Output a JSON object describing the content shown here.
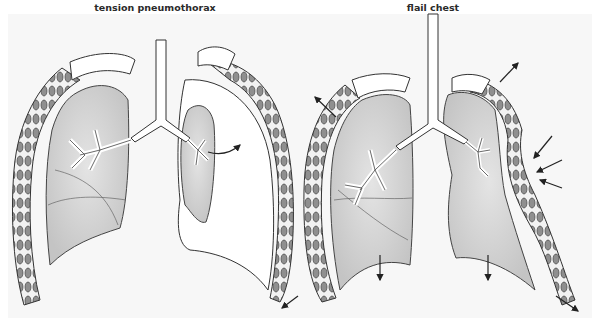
{
  "figure": {
    "panels": [
      {
        "id": "tension-pneumothorax",
        "title": "tension pneumothorax",
        "description": "Left lung normal; right lung collapsed with air filling pleural space; arrow indicates air entering pleural space; chest wall expanded outward",
        "arrows": [
          "air-leak-arrow",
          "chest-expansion-arrow-lower-right"
        ]
      },
      {
        "id": "flail-chest",
        "title": "flail chest",
        "description": "Both lungs shown; flail segment on right side moves inward (paradoxical motion) while rest of chest expands; diaphragm moves down",
        "arrows": [
          "expansion-arrow-upper-left",
          "expansion-arrow-upper-right",
          "paradoxical-inward-arrow-1",
          "paradoxical-inward-arrow-2",
          "paradoxical-inward-arrow-3",
          "diaphragm-down-arrow-left",
          "diaphragm-down-arrow-right",
          "expansion-arrow-lower-right"
        ]
      }
    ],
    "colors": {
      "background": "#f7f7f7",
      "lung_fill": "#d6d6d6",
      "outline": "#3a3a3a",
      "rib_fill": "#9a9a9a",
      "pleura_fill": "#ffffff",
      "arrow": "#222222"
    }
  }
}
